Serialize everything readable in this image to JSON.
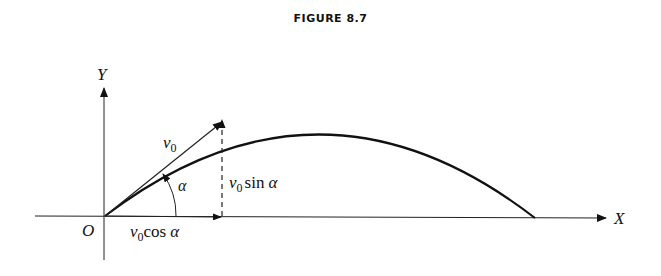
{
  "figure": {
    "title": "FIGURE 8.7",
    "axes": {
      "x_label": "X",
      "y_label": "Y",
      "origin_label": "O"
    },
    "vector": {
      "symbol": "v",
      "subscript": "0",
      "angle": "α"
    },
    "components": {
      "horizontal": {
        "v": "v",
        "sub": "0",
        "fn": "cos",
        "angle": "α"
      },
      "vertical": {
        "v": "v",
        "sub": "0",
        "fn": "sin",
        "angle": "α"
      }
    }
  }
}
